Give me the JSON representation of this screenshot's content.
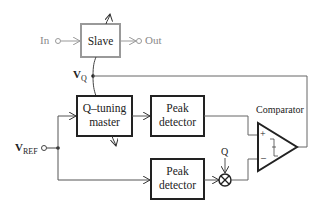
{
  "diagram": {
    "blocks": {
      "slave": {
        "label": "Slave",
        "color": "#999999"
      },
      "q_tuning_master": {
        "line1": "Q–tuning",
        "line2": "master"
      },
      "peak_detector_top": {
        "line1": "Peak",
        "line2": "detector"
      },
      "peak_detector_bottom": {
        "line1": "Peak",
        "line2": "detector"
      },
      "comparator": {
        "label": "Comparator",
        "plus": "+",
        "minus": "–"
      }
    },
    "signals": {
      "in": "In",
      "out": "Out",
      "vq_main": "V",
      "vq_sub": "Q",
      "vref_main": "V",
      "vref_sub": "REF",
      "q": "Q"
    },
    "colors": {
      "line": "#333333",
      "slave": "#999999",
      "feedback": "#666666"
    }
  }
}
